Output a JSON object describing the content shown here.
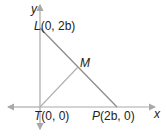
{
  "diagram": {
    "axes": {
      "x_label": "x",
      "y_label": "y"
    },
    "points": [
      {
        "name": "L",
        "coords": "(0, 2b)"
      },
      {
        "name": "M",
        "coords": ""
      },
      {
        "name": "T",
        "coords": "(0, 0)"
      },
      {
        "name": "P",
        "coords": "(2b, 0)"
      }
    ],
    "colors": {
      "axis": "#a9a9a9",
      "segment": "#8c8c8c",
      "text": "#222222"
    }
  }
}
